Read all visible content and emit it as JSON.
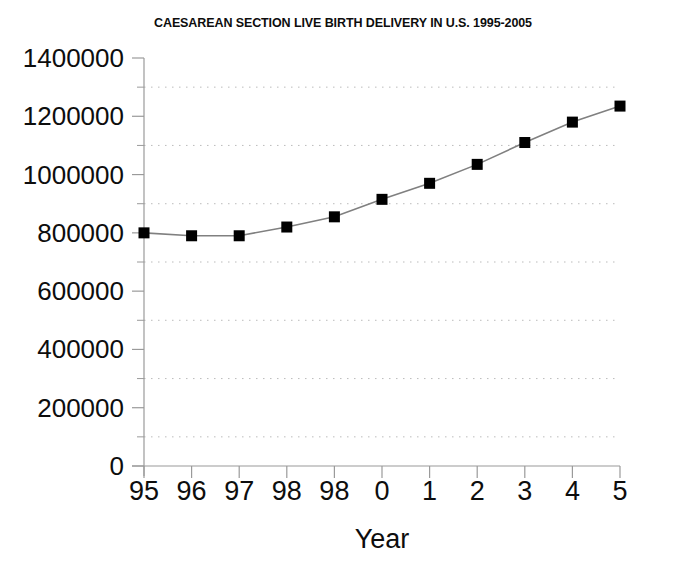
{
  "chart_data": {
    "type": "line",
    "title": "CAESAREAN SECTION LIVE BIRTH DELIVERY IN U.S. 1995-2005",
    "xlabel": "Year",
    "ylabel": "",
    "categories": [
      "95",
      "96",
      "97",
      "98",
      "98",
      "0",
      "1",
      "2",
      "3",
      "4",
      "5"
    ],
    "values": [
      800000,
      790000,
      790000,
      820000,
      855000,
      915000,
      970000,
      1035000,
      1110000,
      1180000,
      1235000
    ],
    "series": [
      {
        "name": "Caesarean section live birth deliveries",
        "values": [
          800000,
          790000,
          790000,
          820000,
          855000,
          915000,
          970000,
          1035000,
          1110000,
          1180000,
          1235000
        ]
      }
    ],
    "ylim": [
      0,
      1400000
    ],
    "ytick_labels": [
      "0",
      "200000",
      "400000",
      "600000",
      "800000",
      "1000000",
      "1200000",
      "1400000"
    ],
    "ytick_values": [
      0,
      200000,
      400000,
      600000,
      800000,
      1000000,
      1200000,
      1400000
    ],
    "yminor_values": [
      100000,
      300000,
      500000,
      700000,
      900000,
      1100000,
      1300000
    ],
    "gridlines": "horizontal dotted at odd 100000 steps",
    "grid": true,
    "legend": "none",
    "marker": "square",
    "marker_color": "#000000",
    "line_color": "#808080",
    "axis_color": "#9a9a9a",
    "grid_color": "#bbbbbb",
    "background": "#ffffff"
  },
  "axes": {
    "x_axis_label": "Year",
    "y_axis_label": ""
  }
}
